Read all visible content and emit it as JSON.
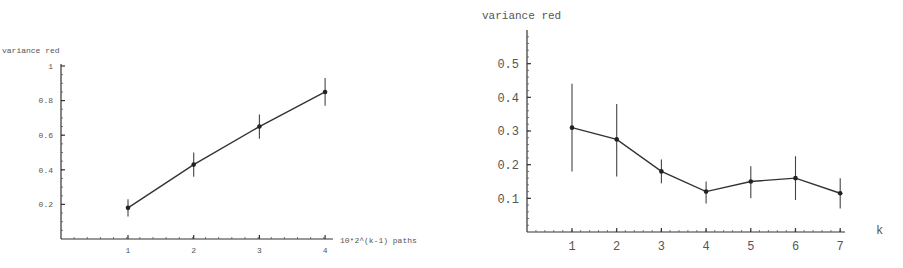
{
  "chart_data": [
    {
      "type": "line",
      "title": "",
      "ylabel": "variance red",
      "xlabel": "10*2^(k-1) paths",
      "x": [
        1,
        2,
        3,
        4
      ],
      "xticks": [
        "1",
        "2",
        "3",
        "4"
      ],
      "yticks": [
        "0.2",
        "0.4",
        "0.6",
        "0.8",
        "1"
      ],
      "ylim": [
        0,
        1
      ],
      "xlim": [
        0,
        4.1
      ],
      "grid": false,
      "series": [
        {
          "name": "variance red",
          "values": [
            0.18,
            0.43,
            0.65,
            0.85
          ],
          "error_low": [
            0.13,
            0.36,
            0.58,
            0.77
          ],
          "error_high": [
            0.23,
            0.5,
            0.72,
            0.93
          ]
        }
      ]
    },
    {
      "type": "line",
      "title": "",
      "ylabel": "variance red",
      "xlabel": "k",
      "x": [
        1,
        2,
        3,
        4,
        5,
        6,
        7
      ],
      "xticks": [
        "1",
        "2",
        "3",
        "4",
        "5",
        "6",
        "7"
      ],
      "yticks": [
        "0.1",
        "0.2",
        "0.3",
        "0.4",
        "0.5"
      ],
      "ylim": [
        0,
        0.6
      ],
      "xlim": [
        0,
        7.1
      ],
      "grid": false,
      "series": [
        {
          "name": "variance red",
          "values": [
            0.31,
            0.275,
            0.18,
            0.12,
            0.15,
            0.16,
            0.115
          ],
          "error_low": [
            0.18,
            0.165,
            0.145,
            0.085,
            0.1,
            0.095,
            0.07
          ],
          "error_high": [
            0.44,
            0.38,
            0.215,
            0.15,
            0.195,
            0.225,
            0.16
          ]
        }
      ]
    }
  ]
}
